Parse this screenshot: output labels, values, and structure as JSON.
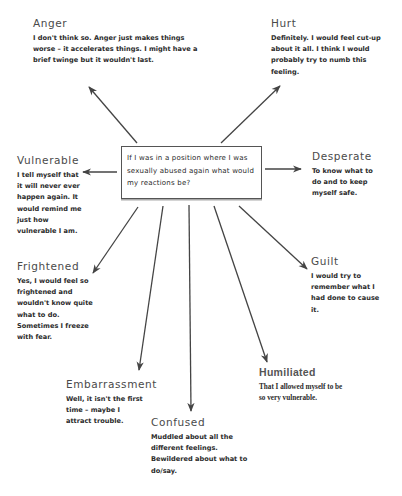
{
  "center": {
    "question": "If I was in a position where I was sexually abused again what would my reactions be?"
  },
  "nodes": [
    {
      "id": "anger",
      "title": "Anger",
      "text": "I don't think so. Anger just makes things worse – it accelerates things. I might have a brief twinge but it wouldn't last."
    },
    {
      "id": "hurt",
      "title": "Hurt",
      "text": "Definitely. I would feel cut-up about it all. I think I would probably try to numb this feeling."
    },
    {
      "id": "vulnerable",
      "title": "Vulnerable",
      "text": "I tell myself that it will never ever happen again. It would remind me just how vulnerable I am."
    },
    {
      "id": "desperate",
      "title": "Desperate",
      "text": "To know what to do and to keep myself safe."
    },
    {
      "id": "frightened",
      "title": "Frightened",
      "text": "Yes, I would feel so frightened and wouldn't know quite what to do. Sometimes I freeze with fear."
    },
    {
      "id": "guilt",
      "title": "Guilt",
      "text": "I would try to remember what I had done to cause it."
    },
    {
      "id": "embarrassment",
      "title": "Embarrassment",
      "text": "Well, it isn't the first time – maybe I attract trouble."
    },
    {
      "id": "humiliated",
      "title": "Humiliated",
      "text": "That I allowed myself to be so very vulnerable."
    },
    {
      "id": "confused",
      "title": "Confused",
      "text": "Muddled about all the different feelings. Bewildered about what to do/say."
    }
  ],
  "colors": {
    "arrow": "#444444",
    "text": "#2a2a2a",
    "title": "#4a4a4a",
    "box_border": "#555555"
  }
}
